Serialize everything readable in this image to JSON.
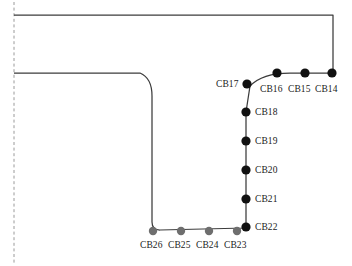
{
  "figure": {
    "type": "engineering-schematic",
    "caption": "",
    "canvas": {
      "width": 352,
      "height": 266,
      "background": "#ffffff"
    },
    "colors": {
      "outline": "#3c3c3c",
      "axis_dashed": "#9a9a9a",
      "node_black": "#111111",
      "node_gray": "#6e6e6e",
      "label_text": "#1a1a1a"
    },
    "symmetry_axis": {
      "name": "centerline",
      "style": "dashed",
      "x": 14,
      "y1": 2,
      "y2": 264
    },
    "outline_path": "M14,15 L333,15 L333,73 L290,73 Q262,73 250,86 L246,112 L246,228 L160,230 Q152,230 152,222 L152,96 Q152,78 140,73 L14,73",
    "nodes": [
      {
        "id": "CB14",
        "label": "CB14",
        "x": 332,
        "y": 73,
        "color": "black",
        "r": 4.6,
        "label_x": 315,
        "label_y": 84,
        "label_align": "left"
      },
      {
        "id": "CB15",
        "label": "CB15",
        "x": 305,
        "y": 73,
        "color": "black",
        "r": 4.6,
        "label_x": 288,
        "label_y": 84,
        "label_align": "left"
      },
      {
        "id": "CB16",
        "label": "CB16",
        "x": 277,
        "y": 73,
        "color": "black",
        "r": 4.6,
        "label_x": 260,
        "label_y": 84,
        "label_align": "left"
      },
      {
        "id": "CB17",
        "label": "CB17",
        "x": 247,
        "y": 84,
        "color": "black",
        "r": 4.6,
        "label_x": 216,
        "label_y": 79,
        "label_align": "left"
      },
      {
        "id": "CB18",
        "label": "CB18",
        "x": 246,
        "y": 112,
        "color": "black",
        "r": 4.6,
        "label_x": 255,
        "label_y": 107,
        "label_align": "left"
      },
      {
        "id": "CB19",
        "label": "CB19",
        "x": 246,
        "y": 141,
        "color": "black",
        "r": 4.6,
        "label_x": 255,
        "label_y": 136,
        "label_align": "left"
      },
      {
        "id": "CB20",
        "label": "CB20",
        "x": 246,
        "y": 170,
        "color": "black",
        "r": 4.6,
        "label_x": 255,
        "label_y": 165,
        "label_align": "left"
      },
      {
        "id": "CB21",
        "label": "CB21",
        "x": 246,
        "y": 199,
        "color": "black",
        "r": 4.6,
        "label_x": 255,
        "label_y": 194,
        "label_align": "left"
      },
      {
        "id": "CB22",
        "label": "CB22",
        "x": 246,
        "y": 227,
        "color": "black",
        "r": 4.6,
        "label_x": 255,
        "label_y": 222,
        "label_align": "left"
      },
      {
        "id": "CB23",
        "label": "CB23",
        "x": 237,
        "y": 231,
        "color": "gray",
        "r": 4.2,
        "label_x": 224,
        "label_y": 240,
        "label_align": "left"
      },
      {
        "id": "CB24",
        "label": "CB24",
        "x": 209,
        "y": 231,
        "color": "gray",
        "r": 4.2,
        "label_x": 196,
        "label_y": 240,
        "label_align": "left"
      },
      {
        "id": "CB25",
        "label": "CB25",
        "x": 181,
        "y": 231,
        "color": "gray",
        "r": 4.2,
        "label_x": 168,
        "label_y": 240,
        "label_align": "left"
      },
      {
        "id": "CB26",
        "label": "CB26",
        "x": 153,
        "y": 231,
        "color": "gray",
        "r": 4.2,
        "label_x": 140,
        "label_y": 240,
        "label_align": "left"
      }
    ]
  }
}
